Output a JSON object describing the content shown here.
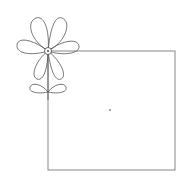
{
  "canvas": {
    "width": 184,
    "height": 184,
    "background": "#ffffff"
  },
  "colors": {
    "stroke": "#555555",
    "dot": "#333333"
  },
  "square": {
    "x": 48,
    "y": 51,
    "width": 127,
    "height": 119
  },
  "flower": {
    "center": {
      "x": 48,
      "y": 51,
      "r": 3.5
    },
    "petals": 6,
    "leaves": 2
  },
  "dot": {
    "x": 110,
    "y": 110,
    "r": 0.8
  }
}
